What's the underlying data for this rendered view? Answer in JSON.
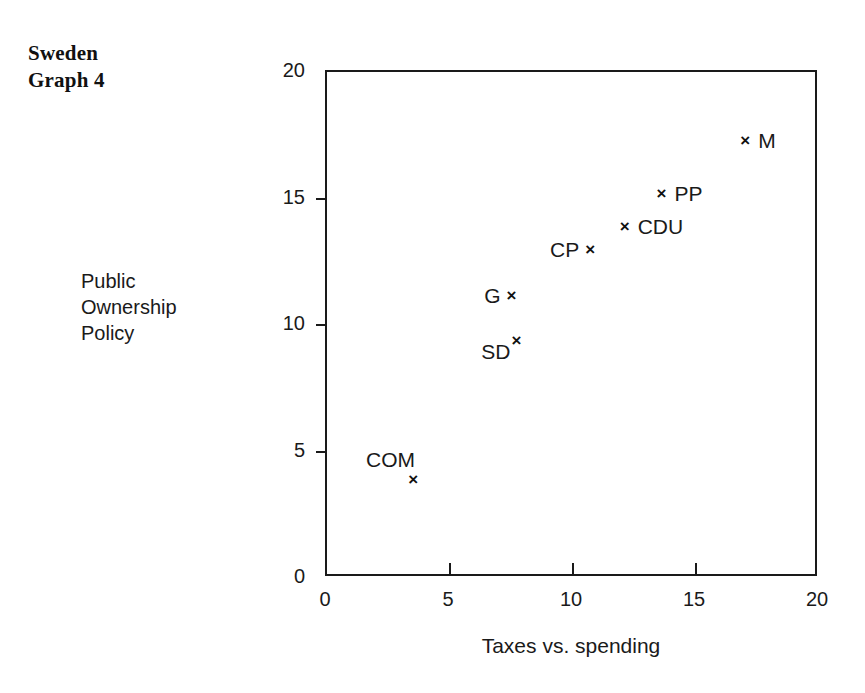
{
  "figure": {
    "title_line1": "Sweden",
    "title_line2": "Graph 4",
    "y_caption_line1": "Public",
    "y_caption_line2": "Ownership",
    "y_caption_line3": "Policy",
    "background_color": "#ffffff",
    "ink_color": "#1a1a1a"
  },
  "chart_data": {
    "type": "scatter",
    "title": "Sweden Graph 4",
    "xlabel": "Taxes vs. spending",
    "ylabel": "Public Ownership Policy",
    "xlim": [
      0,
      20
    ],
    "ylim": [
      0,
      20
    ],
    "xticks": [
      0,
      5,
      10,
      15,
      20
    ],
    "yticks": [
      0,
      5,
      10,
      15,
      20
    ],
    "xtick_labels": [
      "0",
      "5",
      "10",
      "15",
      "20"
    ],
    "ytick_labels": [
      "0",
      "5",
      "10",
      "15",
      "20"
    ],
    "grid": false,
    "legend": false,
    "marker": "x",
    "points": [
      {
        "label": "COM",
        "x": 3.5,
        "y": 3.9,
        "label_pos": "left-above"
      },
      {
        "label": "SD",
        "x": 7.7,
        "y": 9.4,
        "label_pos": "left-below"
      },
      {
        "label": "G",
        "x": 7.5,
        "y": 11.2,
        "label_pos": "left"
      },
      {
        "label": "CP",
        "x": 10.7,
        "y": 13.0,
        "label_pos": "left"
      },
      {
        "label": "CDU",
        "x": 12.1,
        "y": 13.9,
        "label_pos": "right"
      },
      {
        "label": "PP",
        "x": 13.6,
        "y": 15.2,
        "label_pos": "right"
      },
      {
        "label": "M",
        "x": 17.0,
        "y": 17.3,
        "label_pos": "right"
      }
    ]
  }
}
